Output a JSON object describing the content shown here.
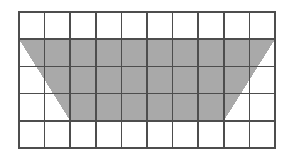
{
  "figure": {
    "background_color": "#ffffff"
  },
  "grid": {
    "name": "unit-square-grid",
    "columns": 10,
    "rows": 5,
    "cell_width_px": 25.6,
    "cell_height_px": 27.2,
    "origin_x_px": 19,
    "origin_y_px": 12,
    "width_px": 256,
    "height_px": 136,
    "line_color": "#4d4d4d",
    "inner_line_width_px": 1.6,
    "outer_line_width_px": 2.2,
    "cell_fill_color": "#ffffff"
  },
  "shape": {
    "name": "shaded-trapezoid",
    "type": "trapezoid",
    "fill_color": "#a9a9a9",
    "stroke": "none",
    "top_base_units": 10,
    "bottom_base_units": 6,
    "height_units": 3,
    "area_square_units": 24,
    "vertices_grid_units": [
      [
        0,
        1
      ],
      [
        10,
        1
      ],
      [
        8,
        4
      ],
      [
        2,
        4
      ]
    ],
    "vertex_labels": [
      "top-left",
      "top-right",
      "bottom-right",
      "bottom-left"
    ],
    "edges": [
      {
        "name": "top-edge",
        "from_units": [
          0,
          1
        ],
        "to_units": [
          10,
          1
        ],
        "orientation": "horizontal",
        "length_units": 10
      },
      {
        "name": "right-diagonal-edge",
        "from_units": [
          10,
          1
        ],
        "to_units": [
          8,
          4
        ],
        "orientation": "diagonal",
        "run_units": -2,
        "rise_units": 3
      },
      {
        "name": "bottom-edge",
        "from_units": [
          8,
          4
        ],
        "to_units": [
          2,
          4
        ],
        "orientation": "horizontal",
        "length_units": 6
      },
      {
        "name": "left-diagonal-edge",
        "from_units": [
          2,
          4
        ],
        "to_units": [
          0,
          1
        ],
        "orientation": "diagonal",
        "run_units": -2,
        "rise_units": -3
      }
    ]
  }
}
